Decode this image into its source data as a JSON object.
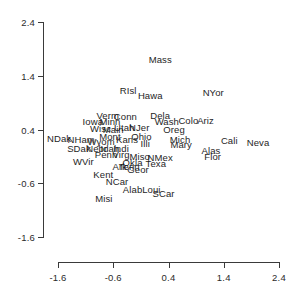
{
  "chart_data": {
    "type": "scatter",
    "title": "",
    "subtitle": "",
    "xlabel": "",
    "ylabel": "",
    "xlim": [
      -2.1,
      2.4
    ],
    "ylim": [
      -1.6,
      2.4
    ],
    "xticks": [
      -1.6,
      -0.6,
      0.4,
      1.4,
      2.4
    ],
    "xticklabels": [
      "-1.6",
      "-0.6",
      "0.4",
      "1.4",
      "2.4"
    ],
    "yticks": [
      -1.6,
      -0.6,
      0.4,
      1.4,
      2.4
    ],
    "yticklabels": [
      "-1.6",
      "-0.6",
      "0.4",
      "1.4",
      "2.4"
    ],
    "grid": false,
    "legend": null,
    "marker_style": "text-label",
    "labels": [
      "Mass",
      "RIsl",
      "Hawa",
      "NYor",
      "Verm",
      "Conn",
      "Dela",
      "Iowa",
      "Minn",
      "Wash",
      "Colo",
      "Ariz",
      "Wisc",
      "Main",
      "Utah",
      "NJer",
      "Oreg",
      "NDak",
      "NHam",
      "Mont",
      "Kans",
      "Ohio",
      "Mich",
      "Cali",
      "Neva",
      "Wyom",
      "Illi",
      "Mary",
      "SDak",
      "Nebr",
      "Idah",
      "Indi",
      "Alas",
      "Penn",
      "Virg",
      "Miso",
      "NMex",
      "Flor",
      "WVir",
      "Okla",
      "Texa",
      "Ark",
      "Tenn",
      "Geor",
      "Kent",
      "NCar",
      "Alab",
      "Loui",
      "SCar",
      "Misi"
    ],
    "points": [
      {
        "label": "Mass",
        "x": 0.25,
        "y": 1.72
      },
      {
        "label": "RIsl",
        "x": -0.33,
        "y": 1.13
      },
      {
        "label": "Hawa",
        "x": 0.07,
        "y": 1.04
      },
      {
        "label": "NYor",
        "x": 1.21,
        "y": 1.1
      },
      {
        "label": "Verm",
        "x": -0.7,
        "y": 0.67
      },
      {
        "label": "Conn",
        "x": -0.38,
        "y": 0.65
      },
      {
        "label": "Dela",
        "x": 0.25,
        "y": 0.67
      },
      {
        "label": "Iowa",
        "x": -0.97,
        "y": 0.55
      },
      {
        "label": "Minn",
        "x": -0.66,
        "y": 0.56
      },
      {
        "label": "Wash",
        "x": 0.37,
        "y": 0.56
      },
      {
        "label": "Colo",
        "x": 0.76,
        "y": 0.58
      },
      {
        "label": "Ariz",
        "x": 1.07,
        "y": 0.58
      },
      {
        "label": "Wisc",
        "x": -0.83,
        "y": 0.42
      },
      {
        "label": "Main",
        "x": -0.6,
        "y": 0.41
      },
      {
        "label": "Utah",
        "x": -0.4,
        "y": 0.44
      },
      {
        "label": "NJer",
        "x": -0.13,
        "y": 0.44
      },
      {
        "label": "Oreg",
        "x": 0.5,
        "y": 0.41
      },
      {
        "label": "NDak",
        "x": -1.58,
        "y": 0.25
      },
      {
        "label": "NHam",
        "x": -1.18,
        "y": 0.23
      },
      {
        "label": "Mont",
        "x": -0.66,
        "y": 0.28
      },
      {
        "label": "Kans",
        "x": -0.35,
        "y": 0.22
      },
      {
        "label": "Ohio",
        "x": -0.09,
        "y": 0.28
      },
      {
        "label": "Mich",
        "x": 0.61,
        "y": 0.22
      },
      {
        "label": "Cali",
        "x": 1.5,
        "y": 0.2
      },
      {
        "label": "Neva",
        "x": 2.02,
        "y": 0.17
      },
      {
        "label": "Wyom",
        "x": -0.82,
        "y": 0.19
      },
      {
        "label": "Illi",
        "x": -0.02,
        "y": 0.15
      },
      {
        "label": "Mary",
        "x": 0.63,
        "y": 0.13
      },
      {
        "label": "SDak",
        "x": -1.22,
        "y": 0.06
      },
      {
        "label": "Nebr",
        "x": -0.9,
        "y": 0.06
      },
      {
        "label": "Idah",
        "x": -0.66,
        "y": 0.05
      },
      {
        "label": "Indi",
        "x": -0.46,
        "y": 0.05
      },
      {
        "label": "Alas",
        "x": 1.17,
        "y": 0.02
      },
      {
        "label": "Penn",
        "x": -0.73,
        "y": -0.06
      },
      {
        "label": "Virg",
        "x": -0.46,
        "y": -0.06
      },
      {
        "label": "Miso",
        "x": -0.12,
        "y": -0.1
      },
      {
        "label": "NMex",
        "x": 0.25,
        "y": -0.11
      },
      {
        "label": "Flor",
        "x": 1.2,
        "y": -0.1
      },
      {
        "label": "WVir",
        "x": -1.14,
        "y": -0.19
      },
      {
        "label": "Okla",
        "x": -0.25,
        "y": -0.2
      },
      {
        "label": "Texa",
        "x": 0.17,
        "y": -0.22
      },
      {
        "label": "Ark",
        "x": -0.48,
        "y": -0.27
      },
      {
        "label": "Tenn",
        "x": -0.31,
        "y": -0.28
      },
      {
        "label": "Geor",
        "x": -0.15,
        "y": -0.34
      },
      {
        "label": "Kent",
        "x": -0.78,
        "y": -0.42
      },
      {
        "label": "NCar",
        "x": -0.53,
        "y": -0.55
      },
      {
        "label": "Alab",
        "x": -0.25,
        "y": -0.7
      },
      {
        "label": "Loui",
        "x": 0.09,
        "y": -0.7
      },
      {
        "label": "SCar",
        "x": 0.31,
        "y": -0.78
      },
      {
        "label": "Misi",
        "x": -0.77,
        "y": -0.88
      }
    ]
  }
}
